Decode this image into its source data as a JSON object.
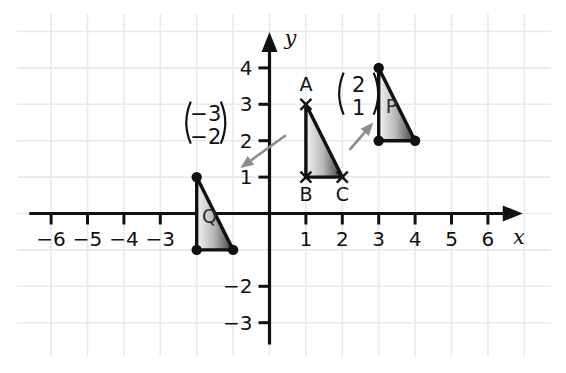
{
  "figure": {
    "type": "coordinate-grid-diagram",
    "background": "#ffffff",
    "grid_color": "#e8e9ea",
    "axis_color": "#111111",
    "arrow_color": "#8d8d8d",
    "shape_fill_light": "#f2f2f2",
    "shape_fill_dark": "#3d3d3d"
  },
  "axes": {
    "x_label": "x",
    "y_label": "y",
    "x_ticks": [
      "−6",
      "−5",
      "−4",
      "−3",
      "1",
      "2",
      "3",
      "4",
      "5",
      "6"
    ],
    "x_tick_values": [
      -6,
      -5,
      -4,
      -3,
      1,
      2,
      3,
      4,
      5,
      6
    ],
    "y_ticks": [
      "4",
      "3",
      "2",
      "1",
      "−2",
      "−3"
    ],
    "y_tick_values": [
      4,
      3,
      2,
      1,
      -2,
      -3
    ],
    "x_range": [
      -6.6,
      6.6
    ],
    "y_range": [
      -3.6,
      4.6
    ]
  },
  "chart_data": {
    "type": "scatter",
    "title": "",
    "xlabel": "x",
    "ylabel": "y",
    "xlim": [
      -6.6,
      6.6
    ],
    "ylim": [
      -3.6,
      4.6
    ],
    "grid": true,
    "legend": "none",
    "shapes": [
      {
        "name": "ABC",
        "label": "",
        "vertex_marker": "cross",
        "vertices": [
          {
            "label": "A",
            "x": 1,
            "y": 3,
            "label_pos": "above"
          },
          {
            "label": "B",
            "x": 1,
            "y": 1,
            "label_pos": "below"
          },
          {
            "label": "C",
            "x": 2,
            "y": 1,
            "label_pos": "below"
          }
        ]
      },
      {
        "name": "P",
        "label": "P",
        "vertex_marker": "dot",
        "label_x": 3.35,
        "label_y": 2.75,
        "vertices": [
          {
            "label": "",
            "x": 3,
            "y": 4
          },
          {
            "label": "",
            "x": 3,
            "y": 2
          },
          {
            "label": "",
            "x": 4,
            "y": 2
          }
        ]
      },
      {
        "name": "Q",
        "label": "Q",
        "vertex_marker": "dot",
        "label_x": -1.65,
        "label_y": -0.25,
        "vertices": [
          {
            "label": "",
            "x": -2,
            "y": 1
          },
          {
            "label": "",
            "x": -2,
            "y": -1
          },
          {
            "label": "",
            "x": -1,
            "y": -1
          }
        ]
      }
    ],
    "vectors": [
      {
        "name": "translation-to-P",
        "top": "2",
        "bottom": "1",
        "from_x": 2.2,
        "from_y": 1.75,
        "to_x": 2.85,
        "to_y": 2.5,
        "label_x": 2.45,
        "label_y": 3.35
      },
      {
        "name": "translation-to-Q",
        "top": "−3",
        "bottom": "−2",
        "from_x": 0.45,
        "from_y": 2.15,
        "to_x": -0.8,
        "to_y": 1.25,
        "label_x": -1.75,
        "label_y": 2.55
      }
    ]
  }
}
